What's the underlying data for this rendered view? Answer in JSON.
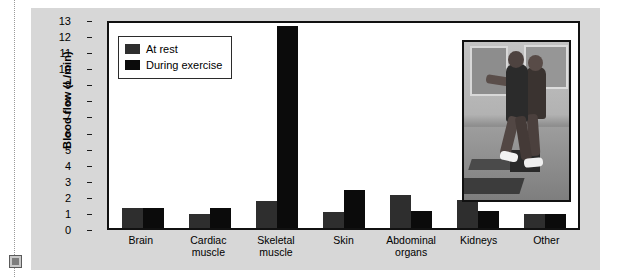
{
  "figure": {
    "background_color": "#d7d7d7",
    "plot_background_color": "#ffffff",
    "border_color": "#111111"
  },
  "margin_rule": {
    "name": "page-margin-dotted-rule",
    "handle_label": ""
  },
  "legend": {
    "position": "top-left-inside-plot",
    "entries": [
      {
        "label": "At rest",
        "color": "#2e2e2e"
      },
      {
        "label": "During exercise",
        "color": "#0b0b0b"
      }
    ]
  },
  "inset": {
    "name": "exercise-photo",
    "description": "Two people performing step aerobics exercise"
  },
  "chart_data": {
    "type": "bar",
    "title": "",
    "xlabel": "",
    "ylabel": "Blood flow (L/min)",
    "ylim": [
      0,
      13
    ],
    "ytick_labels": [
      "13",
      "12",
      "11",
      "10",
      "9",
      "8",
      "7",
      "6",
      "5",
      "4",
      "3",
      "2",
      "1",
      "0"
    ],
    "yticks": [
      13,
      12,
      11,
      10,
      9,
      8,
      7,
      6,
      5,
      4,
      3,
      2,
      1,
      0
    ],
    "grid": false,
    "legend_position": "upper left",
    "categories": [
      "Brain",
      "Cardiac muscle",
      "Skeletal muscle",
      "Skin",
      "Abdominal organs",
      "Kidneys",
      "Other"
    ],
    "category_lines": [
      [
        "Brain"
      ],
      [
        "Cardiac",
        "muscle"
      ],
      [
        "Skeletal",
        "muscle"
      ],
      [
        "Skin"
      ],
      [
        "Abdominal",
        "organs"
      ],
      [
        "Kidneys"
      ],
      [
        "Other"
      ]
    ],
    "series": [
      {
        "name": "At rest",
        "color": "#2e2e2e",
        "values": [
          1.3,
          0.9,
          1.7,
          1.0,
          2.1,
          1.8,
          0.9
        ]
      },
      {
        "name": "During exercise",
        "color": "#0b0b0b",
        "values": [
          1.3,
          1.3,
          12.8,
          2.4,
          1.1,
          1.1,
          0.9
        ]
      }
    ]
  }
}
